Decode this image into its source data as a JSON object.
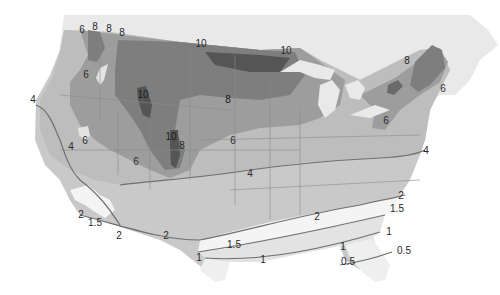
{
  "map": {
    "subject": "Contour map of the contiguous United States and southern Canada",
    "colors": {
      "background": "#ffffff",
      "canada": "#e9e9e9",
      "zone_0_5": "#efefef",
      "zone_1": "#e3e3e3",
      "zone_1_5": "#f4f4f4",
      "zone_2": "#c9c9c9",
      "zone_4": "#bdbdbd",
      "zone_6": "#9d9d9d",
      "zone_8": "#7e7e7e",
      "zone_10": "#555555",
      "contour_line": "#6f6f6f",
      "state_border": "#8c8c8c"
    },
    "contour_labels": [
      {
        "id": "l1",
        "text": "6",
        "x": 82,
        "y": 30
      },
      {
        "id": "l2",
        "text": "8",
        "x": 95,
        "y": 27
      },
      {
        "id": "l3",
        "text": "8",
        "x": 109,
        "y": 29
      },
      {
        "id": "l4",
        "text": "8",
        "x": 122,
        "y": 33
      },
      {
        "id": "l5",
        "text": "10",
        "x": 201,
        "y": 44
      },
      {
        "id": "l6",
        "text": "10",
        "x": 286,
        "y": 51
      },
      {
        "id": "l7",
        "text": "8",
        "x": 407,
        "y": 61
      },
      {
        "id": "l8",
        "text": "6",
        "x": 86,
        "y": 75
      },
      {
        "id": "l9",
        "text": "10",
        "x": 143,
        "y": 95
      },
      {
        "id": "l10",
        "text": "8",
        "x": 228,
        "y": 100
      },
      {
        "id": "l11",
        "text": "6",
        "x": 443,
        "y": 89
      },
      {
        "id": "l12",
        "text": "4",
        "x": 33,
        "y": 100
      },
      {
        "id": "l13",
        "text": "6",
        "x": 386,
        "y": 121
      },
      {
        "id": "l14",
        "text": "6",
        "x": 85,
        "y": 141
      },
      {
        "id": "l15",
        "text": "10",
        "x": 171,
        "y": 137
      },
      {
        "id": "l16",
        "text": "8",
        "x": 182,
        "y": 146
      },
      {
        "id": "l17",
        "text": "4",
        "x": 71,
        "y": 147
      },
      {
        "id": "l18",
        "text": "6",
        "x": 233,
        "y": 141
      },
      {
        "id": "l19",
        "text": "6",
        "x": 136,
        "y": 162
      },
      {
        "id": "l20",
        "text": "4",
        "x": 426,
        "y": 151
      },
      {
        "id": "l21",
        "text": "4",
        "x": 250,
        "y": 174
      },
      {
        "id": "l22",
        "text": "2",
        "x": 401,
        "y": 196
      },
      {
        "id": "l23",
        "text": "1.5",
        "x": 397,
        "y": 209
      },
      {
        "id": "l24",
        "text": "2",
        "x": 81,
        "y": 215
      },
      {
        "id": "l25",
        "text": "1.5",
        "x": 95,
        "y": 223
      },
      {
        "id": "l26",
        "text": "2",
        "x": 317,
        "y": 217
      },
      {
        "id": "l27",
        "text": "2",
        "x": 119,
        "y": 236
      },
      {
        "id": "l28",
        "text": "2",
        "x": 166,
        "y": 236
      },
      {
        "id": "l29",
        "text": "1",
        "x": 389,
        "y": 232
      },
      {
        "id": "l30",
        "text": "1.5",
        "x": 234,
        "y": 245
      },
      {
        "id": "l31",
        "text": "1",
        "x": 199,
        "y": 258
      },
      {
        "id": "l32",
        "text": "1",
        "x": 263,
        "y": 260
      },
      {
        "id": "l33",
        "text": "1",
        "x": 343,
        "y": 247
      },
      {
        "id": "l34",
        "text": "0.5",
        "x": 404,
        "y": 251
      },
      {
        "id": "l35",
        "text": "0.5",
        "x": 348,
        "y": 262
      }
    ]
  }
}
